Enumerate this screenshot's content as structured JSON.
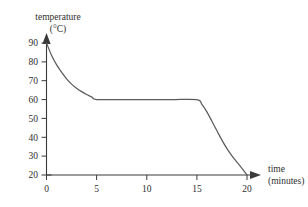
{
  "chart_data": {
    "type": "line",
    "title": "",
    "subtitle": "",
    "xlabel_line1": "time",
    "xlabel_line2": "(minutes)",
    "ylabel_line1": "temperature",
    "ylabel_line2": "(°C)",
    "xlim": [
      0,
      20
    ],
    "ylim": [
      20,
      90
    ],
    "xticks": [
      0,
      5,
      10,
      15,
      20
    ],
    "xtick_labels": [
      "0",
      "5",
      "10",
      "15",
      "20"
    ],
    "yticks": [
      20,
      30,
      40,
      50,
      60,
      70,
      80,
      90
    ],
    "ytick_labels": [
      "20",
      "30",
      "40",
      "50",
      "60",
      "70",
      "80",
      "90"
    ],
    "grid": false,
    "legend": false,
    "legend_position": "none",
    "axis_arrows": true,
    "series": [
      {
        "name": "cooling curve",
        "color": "#5b5b5b",
        "x": [
          0,
          0.5,
          1,
          1.5,
          2,
          2.5,
          3,
          3.5,
          4,
          4.5,
          5,
          7.5,
          10,
          12.5,
          15,
          15.5,
          16,
          16.5,
          17,
          17.5,
          18,
          18.5,
          19,
          19.5,
          20
        ],
        "y": [
          90,
          83.5,
          78.5,
          74.5,
          71,
          68.2,
          66,
          64.2,
          62.7,
          61.4,
          60,
          60,
          60,
          60,
          60,
          57.5,
          53.5,
          48.5,
          43.5,
          38.5,
          34,
          30.2,
          26.8,
          23.5,
          20
        ]
      }
    ],
    "annotations": [
      {
        "text": "initial temperature 90 °C at 0 minutes"
      },
      {
        "text": "plateau at 60 °C from 5 to 15 minutes"
      },
      {
        "text": "final temperature 20 °C at 20 minutes"
      }
    ]
  }
}
